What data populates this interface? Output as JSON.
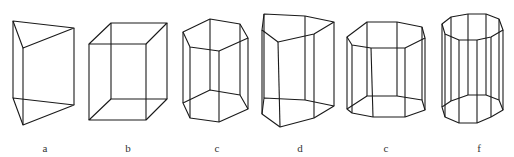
{
  "figure": {
    "stroke_color": "#1a1a1a",
    "stroke_width": 1.1,
    "background": "#ffffff",
    "shapes": [
      {
        "label": "a",
        "name": "triangular-prism",
        "label_pos": [
          45,
          143
        ],
        "top": [
          [
            13,
            21
          ],
          [
            74,
            28
          ],
          [
            23,
            48
          ]
        ],
        "bottom": [
          [
            13,
            98
          ],
          [
            74,
            105
          ],
          [
            23,
            125
          ]
        ]
      },
      {
        "label": "b",
        "name": "rectangular-prism",
        "label_pos": [
          128,
          143
        ],
        "top": [
          [
            89,
            44
          ],
          [
            146,
            44
          ],
          [
            167,
            23
          ],
          [
            111,
            23
          ]
        ],
        "bottom": [
          [
            89,
            120
          ],
          [
            146,
            120
          ],
          [
            167,
            99
          ],
          [
            111,
            99
          ]
        ]
      },
      {
        "label": "c",
        "name": "hexagonal-prism",
        "label_pos": [
          217,
          143
        ],
        "top": [
          [
            183,
            32
          ],
          [
            210,
            19
          ],
          [
            240,
            24
          ],
          [
            248,
            38
          ],
          [
            219,
            51
          ],
          [
            190,
            47
          ]
        ],
        "bottom": [
          [
            183,
            103
          ],
          [
            210,
            90
          ],
          [
            240,
            95
          ],
          [
            248,
            109
          ],
          [
            219,
            122
          ],
          [
            190,
            118
          ]
        ]
      },
      {
        "label": "d",
        "name": "pentagonal-prism",
        "label_pos": [
          300,
          143
        ],
        "top": [
          [
            264,
            14
          ],
          [
            305,
            16
          ],
          [
            334,
            22
          ],
          [
            314,
            34
          ],
          [
            278,
            42
          ],
          [
            262,
            30
          ]
        ],
        "bottom": [
          [
            264,
            98
          ],
          [
            305,
            100
          ],
          [
            334,
            106
          ],
          [
            314,
            118
          ],
          [
            280,
            127
          ],
          [
            262,
            114
          ]
        ]
      },
      {
        "label": "c",
        "name": "octagonal-prism",
        "label_pos": [
          386,
          143
        ],
        "top": [
          [
            347,
            37
          ],
          [
            367,
            22
          ],
          [
            397,
            22
          ],
          [
            422,
            27
          ],
          [
            425,
            38
          ],
          [
            405,
            48
          ],
          [
            371,
            48
          ],
          [
            352,
            45
          ]
        ],
        "bottom": [
          [
            347,
            109
          ],
          [
            367,
            96
          ],
          [
            397,
            96
          ],
          [
            422,
            100
          ],
          [
            425,
            110
          ],
          [
            405,
            117
          ],
          [
            373,
            117
          ],
          [
            352,
            113
          ]
        ]
      },
      {
        "label": "f",
        "name": "decagonal-prism",
        "label_pos": [
          479,
          143
        ],
        "top": [
          [
            442,
            24
          ],
          [
            451,
            17
          ],
          [
            468,
            14
          ],
          [
            486,
            14
          ],
          [
            499,
            19
          ],
          [
            503,
            30
          ],
          [
            491,
            37
          ],
          [
            477,
            40
          ],
          [
            459,
            40
          ],
          [
            445,
            34
          ]
        ],
        "bottom": [
          [
            442,
            107
          ],
          [
            451,
            101
          ],
          [
            468,
            95
          ],
          [
            486,
            95
          ],
          [
            499,
            100
          ],
          [
            503,
            110
          ],
          [
            491,
            117
          ],
          [
            477,
            123
          ],
          [
            459,
            123
          ],
          [
            445,
            117
          ]
        ]
      }
    ]
  }
}
